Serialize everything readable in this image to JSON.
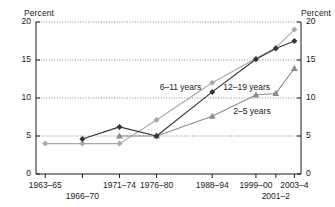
{
  "chart_data": {
    "type": "line",
    "title": "",
    "xlabel": "",
    "ylabel": "Percent",
    "ylabel_right": "Percent",
    "categories": [
      "1963–65",
      "1966–70",
      "1971–74",
      "1976–80",
      "1988–94",
      "1999–00",
      "2001–2",
      "2003–4"
    ],
    "x_tick_labels": [
      "1963–65",
      "1966–70",
      "1971–74",
      "1976–80",
      "1988–94",
      "1999–00",
      "2001–2",
      "2003–4"
    ],
    "ylim": [
      0,
      20
    ],
    "y_ticks": [
      0,
      5,
      10,
      15,
      20
    ],
    "y_tick_labels": [
      "0",
      "5",
      "10",
      "15",
      "20"
    ],
    "grid": true,
    "grid_style": "dotted",
    "legend": "inline-annotations",
    "series": [
      {
        "name": "2–5 years",
        "color": "#8c8c8c",
        "marker": "triangle",
        "x": [
          "1963–65",
          "1966–70",
          "1971–74",
          "1976–80",
          "1988–94",
          "1999–00",
          "2001–2",
          "2003–4"
        ],
        "values": [
          null,
          null,
          5.0,
          5.0,
          7.6,
          10.4,
          10.6,
          13.9
        ]
      },
      {
        "name": "6–11 years",
        "color": "#a8a8a8",
        "marker": "diamond",
        "x": [
          "1963–65",
          "1966–70",
          "1971–74",
          "1976–80",
          "1988–94",
          "1999–00",
          "2001–2",
          "2003–4"
        ],
        "values": [
          4.0,
          4.0,
          4.0,
          7.1,
          12.0,
          15.2,
          16.6,
          19.0
        ]
      },
      {
        "name": "12–19 years",
        "color": "#333333",
        "marker": "diamond",
        "x": [
          "1963–65",
          "1966–70",
          "1971–74",
          "1976–80",
          "1988–94",
          "1999–00",
          "2001–2",
          "2003–4"
        ],
        "values": [
          null,
          4.6,
          6.2,
          5.0,
          10.8,
          15.1,
          16.5,
          17.5
        ]
      }
    ],
    "annotations": [
      {
        "text": "6–11 years",
        "x_frac": 0.545,
        "y_value": 11.45
      },
      {
        "text": "12–19 years",
        "x_frac": 0.795,
        "y_value": 11.5
      },
      {
        "text": "2–5 years",
        "x_frac": 0.815,
        "y_value": 8.35
      }
    ]
  }
}
